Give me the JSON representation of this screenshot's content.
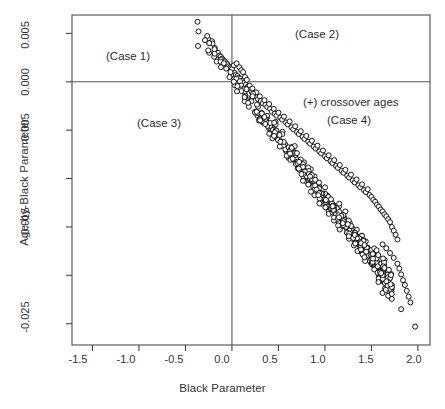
{
  "figure": {
    "background": "#ffffff",
    "frame_color": "#5a5a5a",
    "point_color": "#000000",
    "point_fill": "#ffffff"
  },
  "chart_data": {
    "type": "scatter",
    "title": "",
    "xlabel": "Black Parameter",
    "ylabel": "Age-by-Black Parameter",
    "xlim": [
      -1.72,
      2.13
    ],
    "ylim": [
      -0.0272,
      0.0069
    ],
    "xticks": [
      -1.5,
      -1.0,
      -0.5,
      0.0,
      0.5,
      1.0,
      1.5,
      2.0
    ],
    "xticklabels": [
      "-1.5",
      "-1.0",
      "-0.5",
      "0.0",
      "0.5",
      "1.0",
      "1.5",
      "2.0"
    ],
    "yticks": [
      0.005,
      0.0,
      -0.005,
      -0.01,
      -0.015,
      -0.02,
      -0.025
    ],
    "yticklabels": [
      "0.005",
      "0.000",
      "-0.005",
      "",
      "-0.015",
      "",
      "-0.025"
    ],
    "grid": false,
    "legend": null,
    "reference_lines": [
      {
        "orientation": "vertical",
        "value": 0.0
      },
      {
        "orientation": "horizontal",
        "value": 0.0
      }
    ],
    "annotations": [
      {
        "text": "(Case 1)",
        "x": -0.95,
        "y": 0.0036
      },
      {
        "text": "(Case 2)",
        "x": 1.02,
        "y": 0.0058
      },
      {
        "text": "(+) crossover ages",
        "x": 1.22,
        "y": -0.0021
      },
      {
        "text": "(Case 4)",
        "x": 1.22,
        "y": -0.004
      },
      {
        "text": "(Case 3)",
        "x": -0.6,
        "y": -0.006
      }
    ],
    "series": [
      {
        "name": "regression coefficient pairs",
        "n_points": 620,
        "description": "Dense tight negative-slope band: Age-by-Black parameter decreases approximately linearly as Black parameter increases; slope approx -0.0125 per unit, intercept approx 0.0005.",
        "trend_slope": -0.0125,
        "trend_intercept": 0.0005,
        "x_range": [
          -0.37,
          1.97
        ],
        "y_range": [
          -0.0253,
          0.0062
        ],
        "points": [
          [
            -0.37,
            0.0062
          ],
          [
            -0.36,
            0.0052
          ],
          [
            -0.365,
            0.0037
          ],
          [
            -0.255,
            0.0044
          ],
          [
            -0.215,
            0.0042
          ],
          [
            -0.245,
            0.004
          ],
          [
            -0.185,
            0.0035
          ],
          [
            -0.175,
            0.0031
          ],
          [
            -0.15,
            0.003
          ],
          [
            -0.135,
            0.0027
          ],
          [
            -0.12,
            0.0026
          ],
          [
            -0.105,
            0.0024
          ],
          [
            -0.09,
            0.0022
          ],
          [
            -0.075,
            0.0021
          ],
          [
            -0.06,
            0.0019
          ],
          [
            -0.05,
            0.0018
          ],
          [
            -0.035,
            0.0016
          ],
          [
            -0.02,
            0.0015
          ],
          [
            -0.01,
            0.0014
          ],
          [
            0.0,
            0.0013
          ],
          [
            0.02,
            0.0017
          ],
          [
            0.05,
            0.0019
          ],
          [
            0.08,
            0.0015
          ],
          [
            0.1,
            0.0012
          ],
          [
            0.12,
            0.001
          ],
          [
            0.03,
            0.0009
          ],
          [
            0.04,
            0.0007
          ],
          [
            0.06,
            0.0006
          ],
          [
            0.07,
            0.0004
          ],
          [
            0.09,
            0.0003
          ],
          [
            0.11,
            0.0001
          ],
          [
            0.13,
            -0.0001
          ],
          [
            0.15,
            -0.0003
          ],
          [
            0.14,
            0.0005
          ],
          [
            0.16,
            0.0002
          ],
          [
            0.17,
            -0.0005
          ],
          [
            0.18,
            -0.0006
          ],
          [
            0.19,
            -0.0004
          ],
          [
            0.2,
            -0.0008
          ],
          [
            0.21,
            -0.001
          ],
          [
            0.22,
            -0.0007
          ],
          [
            0.23,
            -0.0012
          ],
          [
            0.25,
            -0.0014
          ],
          [
            0.26,
            -0.0011
          ],
          [
            0.27,
            -0.0016
          ],
          [
            0.28,
            -0.0018
          ],
          [
            0.3,
            -0.0015
          ],
          [
            0.31,
            -0.002
          ],
          [
            0.33,
            -0.0022
          ],
          [
            0.35,
            -0.0019
          ],
          [
            0.36,
            -0.0024
          ],
          [
            0.38,
            -0.0026
          ],
          [
            0.4,
            -0.0023
          ],
          [
            0.41,
            -0.0028
          ],
          [
            0.43,
            -0.0031
          ],
          [
            0.45,
            -0.0028
          ],
          [
            0.46,
            -0.0033
          ],
          [
            0.48,
            -0.0035
          ],
          [
            0.5,
            -0.0032
          ],
          [
            0.52,
            -0.0037
          ],
          [
            0.54,
            -0.0039
          ],
          [
            0.56,
            -0.0036
          ],
          [
            0.58,
            -0.0042
          ],
          [
            0.6,
            -0.0044
          ],
          [
            0.62,
            -0.0041
          ],
          [
            0.64,
            -0.0047
          ],
          [
            0.66,
            -0.0049
          ],
          [
            0.68,
            -0.0046
          ],
          [
            0.7,
            -0.0052
          ],
          [
            0.72,
            -0.0054
          ],
          [
            0.74,
            -0.0051
          ],
          [
            0.76,
            -0.0057
          ],
          [
            0.78,
            -0.0059
          ],
          [
            0.8,
            -0.0056
          ],
          [
            0.82,
            -0.0062
          ],
          [
            0.84,
            -0.0064
          ],
          [
            0.86,
            -0.0061
          ],
          [
            0.88,
            -0.0067
          ],
          [
            0.9,
            -0.0069
          ],
          [
            0.92,
            -0.0066
          ],
          [
            0.94,
            -0.0072
          ],
          [
            0.96,
            -0.0074
          ],
          [
            0.98,
            -0.0071
          ],
          [
            1.0,
            -0.0077
          ],
          [
            1.02,
            -0.0079
          ],
          [
            1.04,
            -0.0076
          ],
          [
            1.06,
            -0.0082
          ],
          [
            1.08,
            -0.0084
          ],
          [
            1.1,
            -0.0081
          ],
          [
            1.12,
            -0.0087
          ],
          [
            1.14,
            -0.0089
          ],
          [
            1.16,
            -0.0086
          ],
          [
            1.18,
            -0.0092
          ],
          [
            1.2,
            -0.0094
          ],
          [
            1.22,
            -0.0091
          ],
          [
            1.24,
            -0.0097
          ],
          [
            1.26,
            -0.0099
          ],
          [
            1.28,
            -0.0096
          ],
          [
            1.3,
            -0.0102
          ],
          [
            1.32,
            -0.0104
          ],
          [
            1.34,
            -0.0101
          ],
          [
            1.36,
            -0.0107
          ],
          [
            1.38,
            -0.0109
          ],
          [
            1.4,
            -0.0106
          ],
          [
            1.42,
            -0.0112
          ],
          [
            1.44,
            -0.0114
          ],
          [
            1.46,
            -0.0111
          ],
          [
            1.48,
            -0.0117
          ],
          [
            1.5,
            -0.0119
          ],
          [
            1.52,
            -0.0122
          ],
          [
            1.54,
            -0.0124
          ],
          [
            1.56,
            -0.0127
          ],
          [
            1.58,
            -0.0129
          ],
          [
            1.6,
            -0.0132
          ],
          [
            1.62,
            -0.0134
          ],
          [
            1.22,
            -0.0134
          ],
          [
            1.64,
            -0.0137
          ],
          [
            1.66,
            -0.0139
          ],
          [
            1.68,
            -0.0142
          ],
          [
            1.7,
            -0.0145
          ],
          [
            1.72,
            -0.015
          ],
          [
            1.74,
            -0.0154
          ],
          [
            1.76,
            -0.0158
          ],
          [
            1.78,
            -0.0163
          ],
          [
            1.62,
            -0.0168
          ],
          [
            1.66,
            -0.0172
          ],
          [
            1.7,
            -0.0177
          ],
          [
            1.74,
            -0.0182
          ],
          [
            1.78,
            -0.0188
          ],
          [
            1.8,
            -0.0193
          ],
          [
            1.82,
            -0.0199
          ],
          [
            1.84,
            -0.0205
          ],
          [
            1.86,
            -0.021
          ],
          [
            1.88,
            -0.0216
          ],
          [
            1.9,
            -0.0222
          ],
          [
            1.92,
            -0.0228
          ],
          [
            1.82,
            -0.0235
          ],
          [
            1.97,
            -0.0253
          ]
        ]
      }
    ]
  },
  "axes": {
    "x_title": "Black Parameter",
    "y_title": "Age-by-Black Parameter"
  }
}
